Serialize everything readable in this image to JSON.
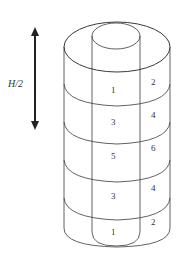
{
  "diagram": {
    "type": "concentric-cylinder-zone-diagram",
    "colors": {
      "stroke": "#3a3a3a",
      "background": "#ffffff",
      "text": "#333333"
    },
    "height_marker": {
      "label": "H/2",
      "direction": "vertical-double-arrow"
    },
    "inner_column_labels": [
      "1",
      "3",
      "5",
      "3",
      "1"
    ],
    "outer_column_labels": [
      "2",
      "4",
      "6",
      "4",
      "2"
    ]
  }
}
